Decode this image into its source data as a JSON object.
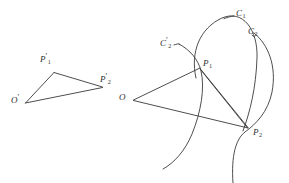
{
  "figure": {
    "background_color": "#ffffff",
    "stroke_color": "#3a3a3a",
    "width": 289,
    "height": 183,
    "left_triangle": {
      "name": "image-triangle",
      "vertices": [
        {
          "id": "O-prime",
          "label_base": "O",
          "prime": "′",
          "sub": "",
          "x": 25,
          "y": 103,
          "label_x": 12,
          "label_y": 97
        },
        {
          "id": "P1-prime",
          "label_base": "P",
          "prime": "′",
          "sub": "1",
          "x": 54,
          "y": 73,
          "label_x": 40,
          "label_y": 56
        },
        {
          "id": "P2-prime",
          "label_base": "P",
          "prime": "′",
          "sub": "2",
          "x": 102,
          "y": 87,
          "label_x": 101,
          "label_y": 76
        }
      ]
    },
    "right_triangle": {
      "name": "object-triangle",
      "vertices": [
        {
          "id": "O",
          "label_base": "O",
          "prime": "",
          "sub": "",
          "x": 133,
          "y": 100,
          "label_x": 120,
          "label_y": 94
        },
        {
          "id": "P1",
          "label_base": "P",
          "prime": "",
          "sub": "1",
          "x": 200,
          "y": 68,
          "label_x": 203,
          "label_y": 60
        },
        {
          "id": "P2",
          "label_base": "P",
          "prime": "",
          "sub": "2",
          "x": 248,
          "y": 128,
          "label_x": 253,
          "label_y": 129
        }
      ]
    },
    "curves": [
      {
        "id": "C1",
        "label_base": "C",
        "prime": "",
        "sub": "1",
        "label_x": 236,
        "label_y": 10
      },
      {
        "id": "C2",
        "label_base": "C",
        "prime": "",
        "sub": "2",
        "label_x": 249,
        "label_y": 28
      },
      {
        "id": "C2-prime",
        "label_base": "C",
        "prime": "′",
        "sub": "2",
        "label_x": 160,
        "label_y": 40
      }
    ]
  }
}
